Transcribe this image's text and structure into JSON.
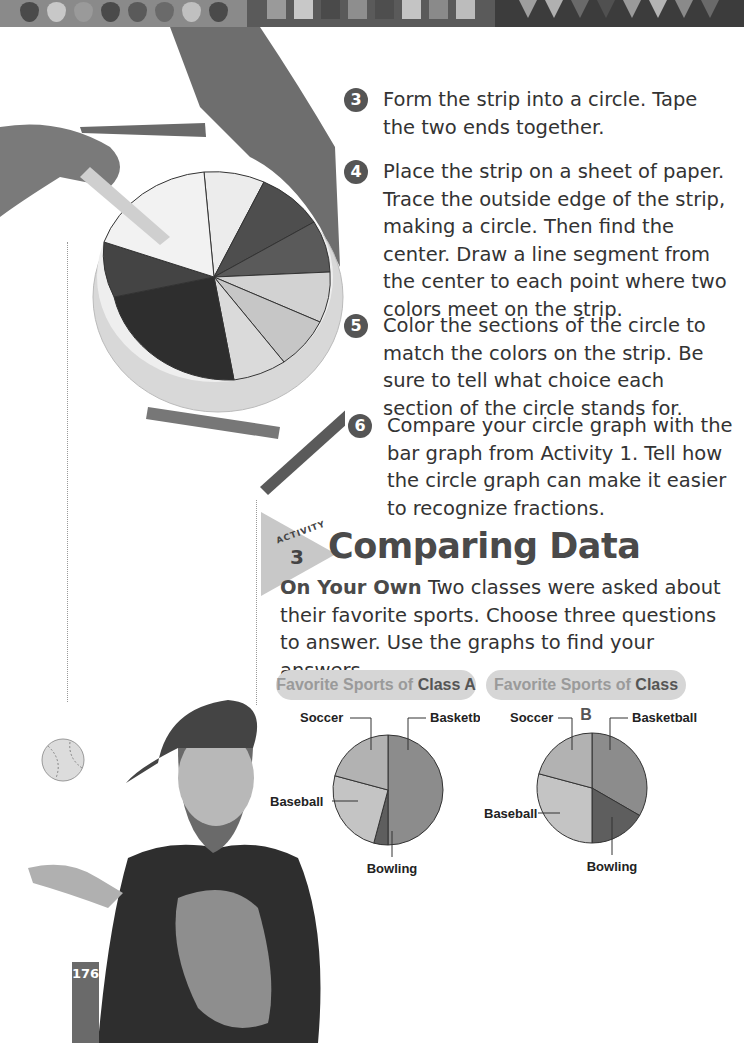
{
  "header_band": {
    "drops": [
      "#4a4a4a",
      "#c8c8c8",
      "#9a9a9a",
      "#4a4a4a",
      "#5a5a5a",
      "#6a6a6a",
      "#c0c0c0",
      "#4a4a4a"
    ],
    "squares": [
      "#9a9a9a",
      "#c8c8c8",
      "#4a4a4a",
      "#8e8e8e",
      "#4e4e4e",
      "#c4c4c4",
      "#8a8a8a",
      "#bcbcbc"
    ],
    "triangles": [
      "#9e9e9e",
      "#b0b0b0",
      "#6a6a6a",
      "#505050",
      "#9a9a9a",
      "#b4b4b4",
      "#8a8a8a",
      "#6a6a6a"
    ]
  },
  "steps": [
    {
      "number": "3",
      "text": "Form the strip into a circle. Tape the two ends together."
    },
    {
      "number": "4",
      "text": "Place the strip on a sheet of paper. Trace the outside edge of the strip, making a circle. Then find the center. Draw a line segment from the center to each point where two colors meet on the strip."
    },
    {
      "number": "5",
      "text": "Color the sections of the circle to match the colors on the strip. Be sure to tell what choice each section of the circle stands for."
    },
    {
      "number": "6",
      "text": "Compare your circle graph with the bar graph from Activity 1. Tell how the circle graph can make it easier to recognize fractions."
    }
  ],
  "activity": {
    "word": "ACTIVITY",
    "number": "3",
    "title": "Comparing Data",
    "lead": "On Your Own",
    "intro": "Two classes were asked about their favorite sports. Choose three questions to answer. Use the graphs to find your answers."
  },
  "charts": {
    "a": {
      "title_prefix": "Favorite Sports of ",
      "title_class": "Class A"
    },
    "b": {
      "title_prefix": "Favorite Sports of ",
      "title_class": "Class B"
    }
  },
  "chart_data": [
    {
      "type": "pie",
      "title": "Favorite Sports of Class A",
      "categories": [
        "Basketball",
        "Bowling",
        "Baseball",
        "Soccer"
      ],
      "values": [
        12,
        1,
        6,
        5
      ],
      "colors": [
        "#8c8c8c",
        "#5e5e5e",
        "#c4c4c4",
        "#b2b2b2"
      ],
      "note": "approximate fractions of 24 read from slice angles"
    },
    {
      "type": "pie",
      "title": "Favorite Sports of Class B",
      "categories": [
        "Basketball",
        "Bowling",
        "Baseball",
        "Soccer"
      ],
      "values": [
        8,
        4,
        7,
        5
      ],
      "colors": [
        "#8c8c8c",
        "#5e5e5e",
        "#c4c4c4",
        "#b2b2b2"
      ],
      "note": "approximate fractions of 24 read from slice angles"
    }
  ],
  "page_number": "176"
}
